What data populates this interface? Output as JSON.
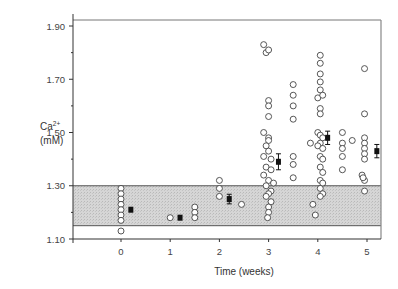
{
  "chart_data": {
    "type": "scatter",
    "title": "",
    "xlabel": "Time (weeks)",
    "ylabel": "Ca2+ (mM)",
    "ylabel_lines": [
      "Ca",
      "(mM)"
    ],
    "ylabel_superscript": "2+",
    "xlim": [
      -0.95,
      5.3
    ],
    "ylim": [
      1.1,
      1.93
    ],
    "x_ticks": [
      0,
      1,
      2,
      3,
      4,
      5
    ],
    "x_tick_labels": [
      "0",
      "1",
      "2",
      "3",
      "4",
      "5"
    ],
    "y_ticks": [
      1.1,
      1.3,
      1.5,
      1.7,
      1.9
    ],
    "y_tick_labels": [
      "1.10",
      "1.30",
      "1.50",
      "1.70",
      "1.90"
    ],
    "y_minor_ticks": [
      1.2,
      1.4,
      1.6,
      1.8
    ],
    "grid": false,
    "legend": null,
    "reference_band": {
      "label": "normal range",
      "ymin": 1.15,
      "ymax": 1.3,
      "color": "#cfcfcf"
    },
    "series": [
      {
        "name": "individual measurements",
        "marker": "open-circle",
        "points": [
          [
            0,
            1.29
          ],
          [
            0,
            1.27
          ],
          [
            0,
            1.25
          ],
          [
            0,
            1.23
          ],
          [
            0,
            1.21
          ],
          [
            0,
            1.19
          ],
          [
            0,
            1.17
          ],
          [
            0,
            1.13
          ],
          [
            1,
            1.18
          ],
          [
            1.5,
            1.22
          ],
          [
            1.5,
            1.2
          ],
          [
            1.5,
            1.18
          ],
          [
            2.0,
            1.32
          ],
          [
            2.0,
            1.29
          ],
          [
            2.0,
            1.26
          ],
          [
            2.45,
            1.23
          ],
          [
            2.9,
            1.83
          ],
          [
            2.95,
            1.8
          ],
          [
            3.0,
            1.81
          ],
          [
            3.0,
            1.62
          ],
          [
            3.0,
            1.6
          ],
          [
            3.0,
            1.56
          ],
          [
            2.9,
            1.5
          ],
          [
            3.0,
            1.48
          ],
          [
            3.0,
            1.47
          ],
          [
            2.95,
            1.45
          ],
          [
            3.0,
            1.43
          ],
          [
            2.9,
            1.41
          ],
          [
            3.05,
            1.4
          ],
          [
            2.95,
            1.37
          ],
          [
            3.05,
            1.36
          ],
          [
            2.9,
            1.34
          ],
          [
            3.0,
            1.32
          ],
          [
            3.1,
            1.31
          ],
          [
            2.95,
            1.3
          ],
          [
            3.05,
            1.28
          ],
          [
            3.0,
            1.27
          ],
          [
            2.95,
            1.26
          ],
          [
            3.05,
            1.24
          ],
          [
            3.0,
            1.22
          ],
          [
            3.0,
            1.2
          ],
          [
            2.98,
            1.18
          ],
          [
            3.5,
            1.68
          ],
          [
            3.5,
            1.64
          ],
          [
            3.5,
            1.6
          ],
          [
            3.5,
            1.55
          ],
          [
            3.5,
            1.41
          ],
          [
            3.5,
            1.38
          ],
          [
            3.5,
            1.33
          ],
          [
            3.85,
            1.46
          ],
          [
            3.9,
            1.23
          ],
          [
            3.95,
            1.19
          ],
          [
            4.05,
            1.79
          ],
          [
            4.05,
            1.76
          ],
          [
            4.05,
            1.72
          ],
          [
            4.05,
            1.69
          ],
          [
            4.05,
            1.66
          ],
          [
            4.0,
            1.63
          ],
          [
            4.1,
            1.64
          ],
          [
            4.05,
            1.59
          ],
          [
            4.05,
            1.57
          ],
          [
            4.0,
            1.5
          ],
          [
            4.05,
            1.49
          ],
          [
            4.1,
            1.48
          ],
          [
            4.05,
            1.46
          ],
          [
            4.0,
            1.45
          ],
          [
            4.1,
            1.44
          ],
          [
            4.05,
            1.41
          ],
          [
            4.1,
            1.4
          ],
          [
            4.05,
            1.37
          ],
          [
            4.1,
            1.35
          ],
          [
            4.05,
            1.32
          ],
          [
            4.1,
            1.31
          ],
          [
            4.05,
            1.29
          ],
          [
            4.1,
            1.27
          ],
          [
            4.05,
            1.26
          ],
          [
            4.5,
            1.5
          ],
          [
            4.5,
            1.46
          ],
          [
            4.5,
            1.44
          ],
          [
            4.5,
            1.41
          ],
          [
            4.5,
            1.36
          ],
          [
            4.7,
            1.47
          ],
          [
            4.95,
            1.74
          ],
          [
            4.95,
            1.57
          ],
          [
            4.95,
            1.48
          ],
          [
            4.95,
            1.46
          ],
          [
            4.95,
            1.44
          ],
          [
            4.95,
            1.42
          ],
          [
            4.95,
            1.4
          ],
          [
            4.9,
            1.34
          ],
          [
            4.95,
            1.32
          ],
          [
            4.92,
            1.33
          ],
          [
            4.95,
            1.28
          ]
        ]
      },
      {
        "name": "mean ± SEM",
        "marker": "filled-square",
        "points": [
          {
            "x": 0.2,
            "y": 1.21,
            "err": 0.01
          },
          {
            "x": 1.2,
            "y": 1.18,
            "err": 0.006
          },
          {
            "x": 2.2,
            "y": 1.25,
            "err": 0.018
          },
          {
            "x": 3.2,
            "y": 1.39,
            "err": 0.03
          },
          {
            "x": 4.2,
            "y": 1.48,
            "err": 0.025
          },
          {
            "x": 5.2,
            "y": 1.43,
            "err": 0.025
          }
        ]
      }
    ]
  },
  "labels": {
    "ylabel_main": "Ca",
    "ylabel_sup": "2+",
    "ylabel_unit": "(mM)",
    "xlabel": "Time (weeks)"
  },
  "colors": {
    "band": "#cfcfcf",
    "axis": "#333333",
    "marker_stroke": "#444444",
    "mean_fill": "#111111"
  }
}
